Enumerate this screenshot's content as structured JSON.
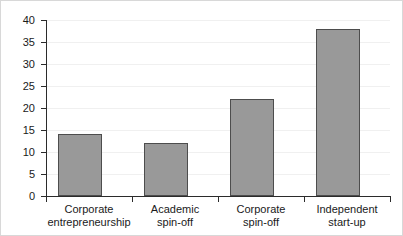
{
  "chart_data": {
    "type": "bar",
    "title": "",
    "subtitle": "",
    "xlabel": "",
    "ylabel": "",
    "ylim": [
      0,
      40
    ],
    "yticks": [
      0,
      5,
      10,
      15,
      20,
      25,
      30,
      35,
      40
    ],
    "ytick_labels": [
      "0",
      "5",
      "10",
      "15",
      "20",
      "25",
      "30",
      "35",
      "40"
    ],
    "grid": true,
    "legend": false,
    "legend_position": "none",
    "categories": [
      "Corporate entrepreneurship",
      "Academic spin-off",
      "Corporate spin-off",
      "Independent start-up"
    ],
    "category_lines": [
      [
        "Corporate",
        "entrepreneurship"
      ],
      [
        "Academic",
        "spin-off"
      ],
      [
        "Corporate",
        "spin-off"
      ],
      [
        "Independent",
        "start-up"
      ]
    ],
    "values": [
      14,
      12,
      22,
      38
    ],
    "bar_color": "#999999",
    "bar_edge_color": "#4d4d4d",
    "axis_color": "#2b2b2b",
    "gridline_color": "#f0f0f0",
    "frame_color": "#d8d8d8",
    "background_color": "#ffffff"
  }
}
